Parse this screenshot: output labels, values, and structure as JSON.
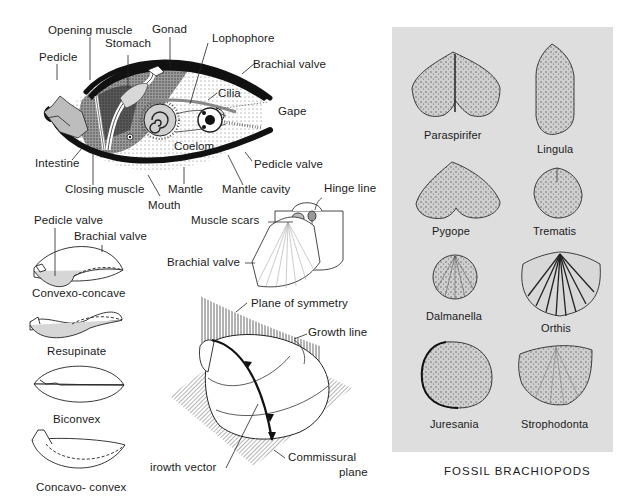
{
  "anatomy_diagram": {
    "labels": {
      "opening_muscle": "Opening muscle",
      "gonad": "Gonad",
      "stomach": "Stomach",
      "lophophore": "Lophophore",
      "pedicle": "Pedicle",
      "brachial_valve": "Brachial valve",
      "cilia": "Cilia",
      "gape": "Gape",
      "coelom": "Coelom",
      "intestine": "Intestine",
      "pedicle_valve": "Pedicle valve",
      "closing_muscle": "Closing muscle",
      "mantle": "Mantle",
      "mantle_cavity": "Mantle cavity",
      "mouth": "Mouth"
    }
  },
  "shell_profiles": {
    "labels": {
      "pedicle_valve": "Pedicle valve",
      "brachial_valve": "Brachial valve"
    },
    "profiles": [
      {
        "name": "Convexo-concave"
      },
      {
        "name": "Resupinate"
      },
      {
        "name": "Biconvex"
      },
      {
        "name": "Concavo- convex"
      }
    ]
  },
  "valve_interior": {
    "labels": {
      "hinge_line": "Hinge line",
      "muscle_scars": "Muscle scars",
      "brachial_valve": "Brachial valve"
    }
  },
  "symmetry_diagram": {
    "labels": {
      "plane_of_symmetry": "Plane of symmetry",
      "growth_line": "Growth line",
      "growth_vector": "irowth vector",
      "commissural_plane_1": "Commissural",
      "commissural_plane_2": "plane"
    }
  },
  "fossil_panel": {
    "background": "#dedede",
    "specimens": [
      {
        "name": "Paraspirifer"
      },
      {
        "name": "Lingula"
      },
      {
        "name": "Pygope"
      },
      {
        "name": "Trematis"
      },
      {
        "name": "Dalmanella"
      },
      {
        "name": "Orthis"
      },
      {
        "name": "Juresania"
      },
      {
        "name": "Strophodonta"
      }
    ],
    "caption": "FOSSIL BRACHIOPODS"
  }
}
